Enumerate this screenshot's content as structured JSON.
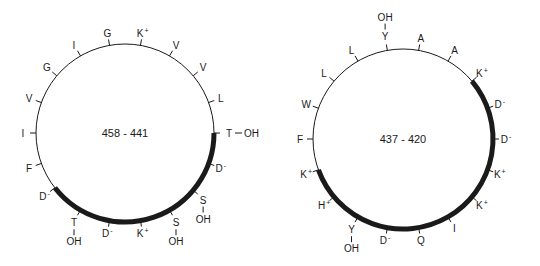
{
  "wheels": [
    {
      "id": "left",
      "label": "458 - 441",
      "cx": 125,
      "cy": 133,
      "r": 89,
      "thick_arc": {
        "start_deg": 90,
        "end_deg": 232
      },
      "residues": [
        {
          "aa": "G",
          "charge": "",
          "oh": false,
          "deg": -10
        },
        {
          "aa": "K",
          "charge": "+",
          "oh": false,
          "deg": 10
        },
        {
          "aa": "V",
          "charge": "",
          "oh": false,
          "deg": 30
        },
        {
          "aa": "V",
          "charge": "",
          "oh": false,
          "deg": 50
        },
        {
          "aa": "L",
          "charge": "",
          "oh": false,
          "deg": 70
        },
        {
          "aa": "T",
          "charge": "",
          "oh": true,
          "deg": 90
        },
        {
          "aa": "D",
          "charge": "-",
          "oh": false,
          "deg": 110
        },
        {
          "aa": "S",
          "charge": "",
          "oh": true,
          "deg": 130
        },
        {
          "aa": "S",
          "charge": "",
          "oh": true,
          "deg": 150
        },
        {
          "aa": "K",
          "charge": "+",
          "oh": false,
          "deg": 170
        },
        {
          "aa": "D",
          "charge": "-",
          "oh": false,
          "deg": 190
        },
        {
          "aa": "T",
          "charge": "",
          "oh": true,
          "deg": 210
        },
        {
          "aa": "D",
          "charge": "-",
          "oh": false,
          "deg": 232
        },
        {
          "aa": "F",
          "charge": "",
          "oh": false,
          "deg": 250
        },
        {
          "aa": "I",
          "charge": "",
          "oh": false,
          "deg": 270
        },
        {
          "aa": "V",
          "charge": "",
          "oh": false,
          "deg": 290
        },
        {
          "aa": "G",
          "charge": "",
          "oh": false,
          "deg": 310
        },
        {
          "aa": "I",
          "charge": "",
          "oh": false,
          "deg": 330
        }
      ]
    },
    {
      "id": "right",
      "label": "437 - 420",
      "cx": 403,
      "cy": 139,
      "r": 90,
      "thick_arc": {
        "start_deg": 50,
        "end_deg": 250
      },
      "residues": [
        {
          "aa": "Y",
          "charge": "",
          "oh": true,
          "deg": -10
        },
        {
          "aa": "A",
          "charge": "",
          "oh": false,
          "deg": 10
        },
        {
          "aa": "A",
          "charge": "",
          "oh": false,
          "deg": 30
        },
        {
          "aa": "K",
          "charge": "+",
          "oh": false,
          "deg": 50
        },
        {
          "aa": "D",
          "charge": "-",
          "oh": false,
          "deg": 70
        },
        {
          "aa": "D",
          "charge": "-",
          "oh": false,
          "deg": 90
        },
        {
          "aa": "K",
          "charge": "+",
          "oh": false,
          "deg": 110
        },
        {
          "aa": "K",
          "charge": "+",
          "oh": false,
          "deg": 130
        },
        {
          "aa": "I",
          "charge": "",
          "oh": false,
          "deg": 150
        },
        {
          "aa": "Q",
          "charge": "",
          "oh": false,
          "deg": 170
        },
        {
          "aa": "D",
          "charge": "-",
          "oh": false,
          "deg": 190
        },
        {
          "aa": "Y",
          "charge": "",
          "oh": true,
          "deg": 210
        },
        {
          "aa": "H",
          "charge": "+",
          "oh": false,
          "deg": 230
        },
        {
          "aa": "K",
          "charge": "+",
          "oh": false,
          "deg": 250
        },
        {
          "aa": "F",
          "charge": "",
          "oh": false,
          "deg": 270
        },
        {
          "aa": "W",
          "charge": "",
          "oh": false,
          "deg": 290
        },
        {
          "aa": "L",
          "charge": "",
          "oh": false,
          "deg": 310
        },
        {
          "aa": "L",
          "charge": "",
          "oh": false,
          "deg": 330
        }
      ]
    }
  ],
  "oh_label": "OH",
  "colors": {
    "line": "#1a1a1a",
    "background": "#ffffff"
  }
}
